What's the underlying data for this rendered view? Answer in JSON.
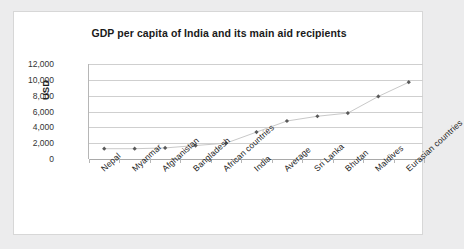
{
  "chart_data": {
    "type": "line",
    "title": "GDP per capita of India and its main aid recipients",
    "xlabel": "",
    "ylabel": "USD",
    "categories": [
      "Nepal",
      "Myanmar",
      "Afghanistan",
      "Bangladesh",
      "African countries",
      "India",
      "Average",
      "Sri Lanka",
      "Bhutan",
      "Maldives",
      "Eurasian countries"
    ],
    "values": [
      1300,
      1300,
      1400,
      1700,
      2000,
      3400,
      4800,
      5400,
      5800,
      7900,
      9700
    ],
    "ylim": [
      0,
      12000
    ],
    "yticks": [
      0,
      2000,
      4000,
      6000,
      8000,
      10000,
      12000
    ],
    "ytick_labels": [
      "0",
      "2,000",
      "4,000",
      "6,000",
      "8,000",
      "10,000",
      "12,000"
    ],
    "grid": true,
    "legend": "none",
    "marker": "diamond",
    "line_color": "#c9c9c9",
    "marker_color": "#595959"
  },
  "panel": {
    "background": "#ffffff",
    "border_color": "#d7d7d7",
    "outer_background": "#ececed"
  }
}
